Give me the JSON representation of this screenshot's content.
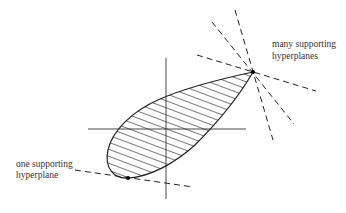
{
  "diagram": {
    "labels": {
      "many": [
        "many supporting",
        "hyperplanes"
      ],
      "one": [
        "one supporting",
        "hyperplane"
      ]
    },
    "colors": {
      "stroke": "#222222",
      "text": "#333333",
      "background": "#ffffff"
    },
    "points": {
      "corner_vertex": [
        253,
        72
      ],
      "smooth_point": [
        128,
        178
      ]
    },
    "axes": {
      "horizontal": [
        [
          88,
          129
        ],
        [
          246,
          129
        ]
      ],
      "vertical": [
        [
          166,
          58
        ],
        [
          166,
          199
        ]
      ]
    },
    "dashed_lines_many": [
      [
        [
          235,
          10
        ],
        [
          273,
          140
        ]
      ],
      [
        [
          212,
          22
        ],
        [
          294,
          124
        ]
      ],
      [
        [
          197,
          55
        ],
        [
          316,
          91
        ]
      ]
    ],
    "dashed_line_one": [
      [
        75,
        170
      ],
      [
        193,
        187
      ]
    ]
  }
}
